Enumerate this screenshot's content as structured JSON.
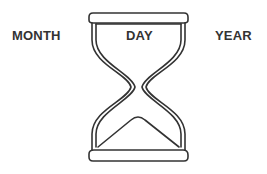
{
  "labels": {
    "left": "MONTH",
    "center": "DAY",
    "right": "YEAR"
  },
  "icon": {
    "name": "hourglass-icon",
    "stroke_color": "#333333",
    "fill_color": "#ffffff"
  }
}
